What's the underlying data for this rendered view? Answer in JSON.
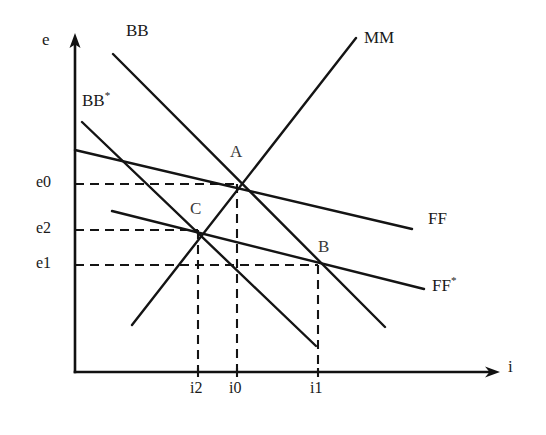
{
  "figure": {
    "background_color": "#ffffff",
    "line_color": "#141414"
  },
  "axes": {
    "y_axis": {
      "name": "vertical-axis",
      "label": "e",
      "label_x": 42,
      "label_y": 38,
      "x": 75,
      "y_top": 36,
      "y_bottom": 372,
      "arrow": "up"
    },
    "x_axis": {
      "name": "horizontal-axis",
      "label": "i",
      "label_x": 508,
      "label_y": 365,
      "y": 372,
      "x_left": 75,
      "x_right": 500,
      "arrow": "right"
    }
  },
  "curves": [
    {
      "id": "BB",
      "label": "BB",
      "has_star": false,
      "label_x": 126,
      "label_y": 26,
      "x1": 113,
      "y1": 54,
      "x2": 385,
      "y2": 327,
      "slope_sign": "negative"
    },
    {
      "id": "BBstar",
      "label": "BB",
      "has_star": true,
      "label_x": 82,
      "label_y": 94,
      "x1": 82,
      "y1": 122,
      "x2": 316,
      "y2": 346,
      "slope_sign": "negative"
    },
    {
      "id": "MM",
      "label": "MM",
      "has_star": false,
      "label_x": 364,
      "label_y": 33,
      "x1": 132,
      "y1": 325,
      "x2": 356,
      "y2": 38,
      "slope_sign": "positive"
    },
    {
      "id": "FF",
      "label": "FF",
      "has_star": false,
      "label_x": 428,
      "label_y": 215,
      "x1": 75,
      "y1": 150,
      "x2": 412,
      "y2": 229,
      "slope_sign": "negative"
    },
    {
      "id": "FFstar",
      "label": "FF",
      "has_star": true,
      "label_x": 432,
      "label_y": 280,
      "x1": 112,
      "y1": 211,
      "x2": 424,
      "y2": 289,
      "slope_sign": "negative"
    }
  ],
  "points": [
    {
      "id": "A",
      "label": "A",
      "x": 237,
      "y": 184,
      "label_x": 230,
      "label_y": 146,
      "curves": [
        "BB",
        "MM",
        "FF"
      ]
    },
    {
      "id": "B",
      "label": "B",
      "x": 318,
      "y": 265,
      "label_x": 318,
      "label_y": 240,
      "curves": [
        "BB",
        "FFstar"
      ]
    },
    {
      "id": "C",
      "label": "C",
      "x": 198,
      "y": 230,
      "label_x": 190,
      "label_y": 203,
      "curves": [
        "BBstar",
        "MM",
        "FFstar"
      ]
    }
  ],
  "y_values": [
    {
      "id": "e0",
      "label": "e0",
      "y": 184,
      "label_x": 36,
      "label_y": 176,
      "dash_to_x": 237
    },
    {
      "id": "e2",
      "label": "e2",
      "y": 230,
      "label_x": 36,
      "label_y": 222,
      "dash_to_x": 198
    },
    {
      "id": "e1",
      "label": "e1",
      "y": 265,
      "label_x": 36,
      "label_y": 257,
      "dash_to_x": 318
    }
  ],
  "x_values": [
    {
      "id": "i2",
      "label": "i2",
      "x": 198,
      "label_x": 190,
      "label_y": 382,
      "dash_to_y": 230
    },
    {
      "id": "i0",
      "label": "i0",
      "x": 237,
      "label_x": 229,
      "label_y": 382,
      "dash_to_y": 184
    },
    {
      "id": "i1",
      "label": "i1",
      "x": 318,
      "label_x": 310,
      "label_y": 382,
      "dash_to_y": 265
    }
  ]
}
